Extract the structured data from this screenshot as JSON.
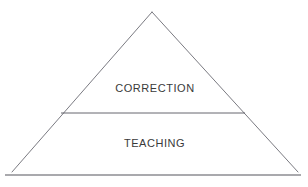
{
  "diagram": {
    "type": "pyramid",
    "background_color": "#ffffff",
    "stroke_color": "#6b6b73",
    "baseline_color": "#55555d",
    "text_color": "#3a3a3a",
    "apex": {
      "x": 152,
      "y": 12
    },
    "bottom_left": {
      "x": 12,
      "y": 172
    },
    "bottom_right": {
      "x": 298,
      "y": 172
    },
    "divider": {
      "x1": 61,
      "y1": 113,
      "x2": 245,
      "y2": 113
    },
    "baseline": {
      "x1": 5,
      "y1": 175,
      "x2": 301,
      "y2": 175
    },
    "tiers": [
      {
        "id": "tier-top",
        "label": "CORRECTION",
        "order": 1
      },
      {
        "id": "tier-bottom",
        "label": "TEACHING",
        "order": 2
      }
    ],
    "caption": {
      "visible": false,
      "text": ""
    }
  }
}
